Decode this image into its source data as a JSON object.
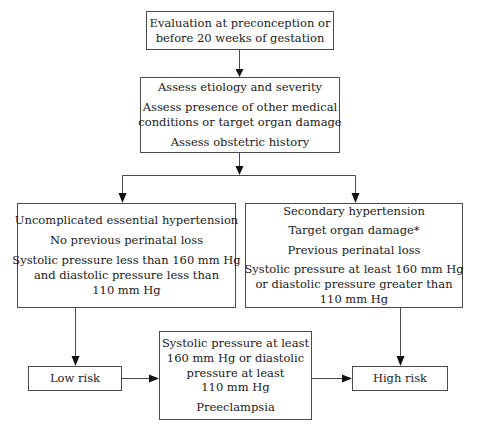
{
  "diagram": {
    "footnote_marker": "*",
    "colors": {
      "background": "#ffffff",
      "box_border": "#4a4a4a",
      "connector": "#4a4a4a",
      "arrowhead": "#111111",
      "text": "#1a1a1a"
    }
  },
  "nodes": {
    "evaluation": {
      "name": "evaluation-node",
      "lines": [
        "Evaluation at preconception or",
        "before 20 weeks of gestation"
      ]
    },
    "assess": {
      "name": "assess-node",
      "lines": [
        "Assess etiology and severity",
        "Assess presence of other medical",
        "conditions or target organ damage",
        "Assess obstetric history"
      ]
    },
    "uncomplicated": {
      "name": "uncomplicated-essential-hypertension-node",
      "lines": [
        "Uncomplicated essential hypertension",
        "No previous perinatal loss",
        "Systolic pressure less than 160 mm Hg",
        "and diastolic pressure less than",
        "110 mm Hg"
      ]
    },
    "secondary": {
      "name": "secondary-hypertension-node",
      "lines": [
        "Secondary hypertension",
        "Target organ damage*",
        "Previous perinatal loss",
        "Systolic pressure at least 160 mm Hg",
        "or diastolic pressure greater than",
        "110 mm Hg"
      ]
    },
    "low_risk": {
      "name": "low-risk-node",
      "lines": [
        "Low risk"
      ]
    },
    "preeclampsia": {
      "name": "preeclampsia-node",
      "lines": [
        "Systolic pressure at least",
        "160 mm Hg or diastolic",
        "pressure at least",
        "110 mm Hg",
        "Preeclampsia"
      ]
    },
    "high_risk": {
      "name": "high-risk-node",
      "lines": [
        "High risk"
      ]
    }
  },
  "edges": [
    {
      "id": "evaluation-to-assess",
      "from": "evaluation",
      "to": "assess",
      "kind": "vertical-arrow"
    },
    {
      "id": "assess-to-branch",
      "from": "assess",
      "to": "branch-bar",
      "kind": "vertical-arrow"
    },
    {
      "id": "branch-to-uncomplicated",
      "from": "branch-bar",
      "to": "uncomplicated",
      "kind": "elbow-arrow"
    },
    {
      "id": "branch-to-secondary",
      "from": "branch-bar",
      "to": "secondary",
      "kind": "elbow-arrow"
    },
    {
      "id": "uncomplicated-to-low-risk",
      "from": "uncomplicated",
      "to": "low_risk",
      "kind": "vertical-arrow"
    },
    {
      "id": "secondary-to-high-risk",
      "from": "secondary",
      "to": "high_risk",
      "kind": "vertical-arrow"
    },
    {
      "id": "low-risk-to-preeclampsia",
      "from": "low_risk",
      "to": "preeclampsia",
      "kind": "horizontal-arrow"
    },
    {
      "id": "preeclampsia-to-high-risk",
      "from": "preeclampsia",
      "to": "high_risk",
      "kind": "horizontal-arrow"
    }
  ]
}
